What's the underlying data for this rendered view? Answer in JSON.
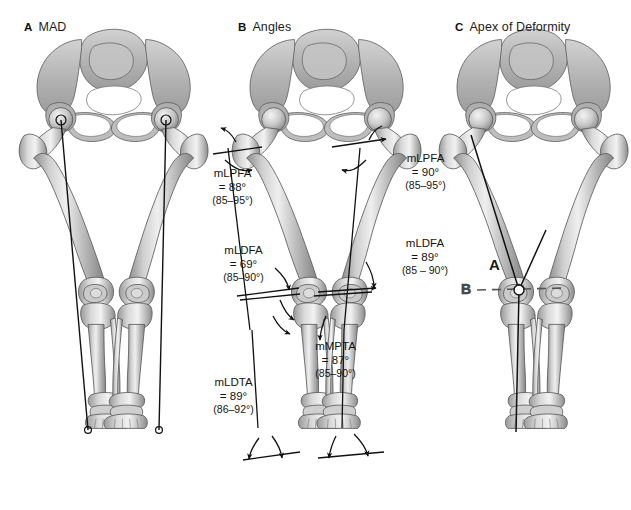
{
  "figure": {
    "background_color": "#ffffff",
    "bone_fill": "#b9b9b9",
    "bone_outline": "#4a4a4a",
    "line_color": "#111111"
  },
  "panels": [
    {
      "letter": "A",
      "title": "MAD"
    },
    {
      "letter": "B",
      "title": "Angles"
    },
    {
      "letter": "C",
      "title": "Apex of Deformity"
    }
  ],
  "annotations": {
    "lpfa_left": {
      "name": "mLPFA",
      "value": "= 88°",
      "range": "(85–95°)"
    },
    "lpfa_right": {
      "name": "mLPFA",
      "value": "= 90°",
      "range": "(85–95°)"
    },
    "ldfa_left": {
      "name": "mLDFA",
      "value": "= 69°",
      "range": "(85–90°)"
    },
    "ldfa_right": {
      "name": "mLDFA",
      "value": "= 89°",
      "range": "(85 – 90°)"
    },
    "mpta": {
      "name": "mMPTA",
      "value": "= 87°",
      "range": "(85–90°)"
    },
    "ldta": {
      "name": "mLDTA",
      "value": "= 89°",
      "range": "(86–92°)"
    }
  },
  "apex_labels": {
    "apex_line": "A",
    "bisector_line": "B"
  }
}
